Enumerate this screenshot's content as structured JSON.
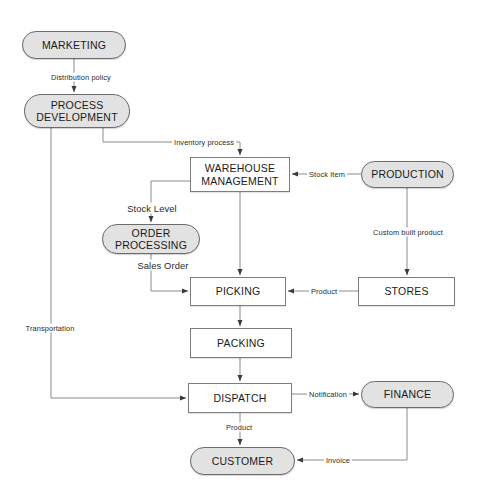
{
  "diagram": {
    "type": "flowchart",
    "background_color": "#ffffff",
    "entity_fill_color": "#e2e2e2",
    "entity_border_color": "#6b6b6b",
    "process_fill_color": "#ffffff",
    "process_border_color": "#7d7d7d",
    "edge_color": "#8a8a8a",
    "text_color": "#1a1a1a"
  },
  "nodes": [
    {
      "id": "marketing",
      "label": "MARKETING",
      "shape": "rounded",
      "x": 22,
      "y": 31,
      "w": 104,
      "h": 28
    },
    {
      "id": "process_dev",
      "label": "PROCESS\nDEVELOPMENT",
      "shape": "rounded",
      "x": 24,
      "y": 94,
      "w": 106,
      "h": 34
    },
    {
      "id": "warehouse",
      "label": "WAREHOUSE\nMANAGEMENT",
      "shape": "rect",
      "x": 190,
      "y": 157,
      "w": 100,
      "h": 35
    },
    {
      "id": "production",
      "label": "PRODUCTION",
      "shape": "rounded",
      "x": 361,
      "y": 161,
      "w": 93,
      "h": 27
    },
    {
      "id": "order_proc",
      "label": "ORDER\nPROCESSING",
      "shape": "rounded",
      "x": 102,
      "y": 224,
      "w": 98,
      "h": 30
    },
    {
      "id": "picking",
      "label": "PICKING",
      "shape": "rect",
      "x": 190,
      "y": 277,
      "w": 96,
      "h": 29
    },
    {
      "id": "stores",
      "label": "STORES",
      "shape": "rect",
      "x": 358,
      "y": 277,
      "w": 97,
      "h": 29
    },
    {
      "id": "packing",
      "label": "PACKING",
      "shape": "rect",
      "x": 190,
      "y": 328,
      "w": 102,
      "h": 30
    },
    {
      "id": "dispatch",
      "label": "DISPATCH",
      "shape": "rect",
      "x": 188,
      "y": 383,
      "w": 104,
      "h": 30
    },
    {
      "id": "finance",
      "label": "FINANCE",
      "shape": "rounded",
      "x": 361,
      "y": 381,
      "w": 93,
      "h": 27
    },
    {
      "id": "customer",
      "label": "CUSTOMER",
      "shape": "rounded",
      "x": 190,
      "y": 447,
      "w": 105,
      "h": 28
    }
  ],
  "edges": [
    {
      "id": "e1",
      "from": "marketing",
      "to": "process_dev",
      "label": "Distribution policy",
      "label_x": 81,
      "label_y": 77,
      "size": "small"
    },
    {
      "id": "e2",
      "from": "process_dev",
      "to": "warehouse",
      "label": "Inventory process",
      "label_x": 204,
      "label_y": 142,
      "size": "small"
    },
    {
      "id": "e3",
      "from": "production",
      "to": "warehouse",
      "label": "Stock Item",
      "label_x": 327,
      "label_y": 174,
      "size": "small"
    },
    {
      "id": "e4",
      "from": "warehouse",
      "to": "order_proc",
      "label": "Stock  Level",
      "label_x": 152,
      "label_y": 208,
      "size": "big"
    },
    {
      "id": "e5",
      "from": "production",
      "to": "stores",
      "label": "Custom built product",
      "label_x": 408,
      "label_y": 232,
      "size": "small"
    },
    {
      "id": "e6",
      "from": "order_proc",
      "to": "picking",
      "label": "Sales Order",
      "label_x": 163,
      "label_y": 265,
      "size": "big"
    },
    {
      "id": "e7",
      "from": "warehouse",
      "to": "picking",
      "label": "",
      "label_x": 0,
      "label_y": 0,
      "size": "small"
    },
    {
      "id": "e8",
      "from": "stores",
      "to": "picking",
      "label": "Product",
      "label_x": 324,
      "label_y": 291,
      "size": "small"
    },
    {
      "id": "e9",
      "from": "picking",
      "to": "packing",
      "label": "",
      "label_x": 0,
      "label_y": 0,
      "size": "small"
    },
    {
      "id": "e10",
      "from": "packing",
      "to": "dispatch",
      "label": "",
      "label_x": 0,
      "label_y": 0,
      "size": "small"
    },
    {
      "id": "e11",
      "from": "process_dev",
      "to": "dispatch",
      "label": "Transportation",
      "label_x": 50,
      "label_y": 328,
      "size": "small"
    },
    {
      "id": "e12",
      "from": "dispatch",
      "to": "finance",
      "label": "Notification",
      "label_x": 328,
      "label_y": 394,
      "size": "small"
    },
    {
      "id": "e13",
      "from": "dispatch",
      "to": "customer",
      "label": "Product",
      "label_x": 239,
      "label_y": 427,
      "size": "small"
    },
    {
      "id": "e14",
      "from": "finance",
      "to": "customer",
      "label": "Invoice",
      "label_x": 338,
      "label_y": 460,
      "size": "small"
    }
  ]
}
